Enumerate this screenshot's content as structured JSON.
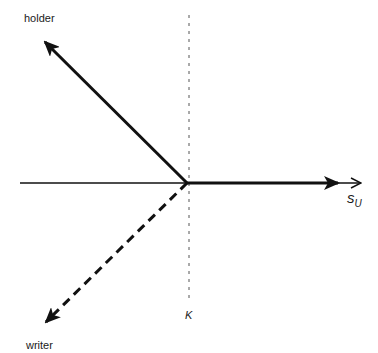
{
  "diagram": {
    "type": "option payoff diagram",
    "labels": {
      "holder": "holder",
      "writer": "writer",
      "strike": "K",
      "axis_main": "s",
      "axis_sub": "U"
    },
    "colors": {
      "line": "#111111",
      "strike_line": "#555555",
      "background": "#ffffff"
    },
    "elements": {
      "horizontal_axis": {
        "from": [
          20,
          183
        ],
        "to": [
          361,
          183
        ],
        "style": "thin arrow"
      },
      "strike_line": {
        "x": 189,
        "from_y": 15,
        "to_y": 300,
        "style": "dotted"
      },
      "holder_payoff": {
        "segments": [
          [
            [
              187,
              183
            ],
            [
              45,
              42
            ]
          ],
          [
            [
              187,
              183
            ],
            [
              338,
              183
            ]
          ]
        ],
        "style": "thick solid arrows"
      },
      "writer_payoff": {
        "segments": [
          [
            [
              187,
              183
            ],
            [
              46,
              322
            ]
          ]
        ],
        "style": "thick dashed arrow"
      }
    }
  }
}
